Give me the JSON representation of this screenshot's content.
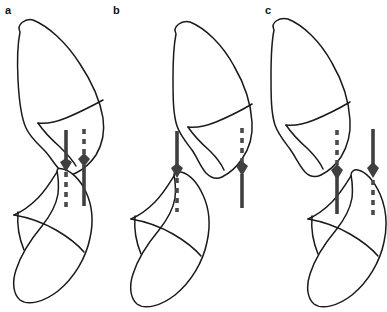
{
  "figure": {
    "background_color": "#ffffff",
    "width": 387,
    "height": 312,
    "colors": {
      "outline_stroke": "#1a1a1a",
      "axis_solid": "#3f3f3f",
      "axis_dashed": "#4a4a4a",
      "label_text": "#111111",
      "fill": "#ffffff"
    },
    "panels": [
      {
        "id": "a",
        "label": "a",
        "label_x": 5,
        "label_y": 14,
        "description": "Proximal and distal bone segments in near-contact alignment; two vertical measurement axes cross at the joint line",
        "axes": [
          {
            "name": "left-axis",
            "x": 66,
            "top": 130,
            "bottom": 212,
            "arrow_y": 166,
            "upper_style": "solid",
            "lower_style": "dashed"
          },
          {
            "name": "right-axis",
            "x": 84,
            "top": 129,
            "bottom": 206,
            "arrow_y": 161,
            "upper_style": "dashed",
            "lower_style": "solid"
          }
        ]
      },
      {
        "id": "b",
        "label": "b",
        "label_x": 113,
        "label_y": 14,
        "description": "Bone segments displaced apart with a wider offset between the two measurement axes",
        "axes": [
          {
            "name": "left-axis",
            "x": 177,
            "top": 131,
            "bottom": 212,
            "arrow_y": 170,
            "upper_style": "solid",
            "lower_style": "dashed"
          },
          {
            "name": "right-axis",
            "x": 242,
            "top": 128,
            "bottom": 208,
            "arrow_y": 170,
            "upper_style": "dashed",
            "lower_style": "solid"
          }
        ]
      },
      {
        "id": "c",
        "label": "c",
        "label_x": 265,
        "label_y": 14,
        "description": "Bone segments overlapping with moderate offset between the two measurement axes",
        "axes": [
          {
            "name": "left-axis",
            "x": 337,
            "top": 130,
            "bottom": 214,
            "arrow_y": 172,
            "upper_style": "dashed",
            "lower_style": "solid"
          },
          {
            "name": "right-axis",
            "x": 373,
            "top": 129,
            "bottom": 215,
            "arrow_y": 170,
            "upper_style": "solid",
            "lower_style": "dashed"
          }
        ]
      }
    ]
  }
}
